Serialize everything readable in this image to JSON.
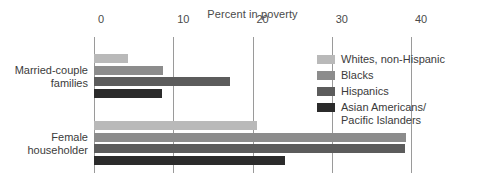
{
  "chart_data": {
    "type": "bar",
    "orientation": "horizontal",
    "title": "Percent in poverty",
    "xlabel": "",
    "ylabel": "",
    "xlim": [
      0,
      42
    ],
    "xticks": [
      0,
      10,
      20,
      30,
      40
    ],
    "xtick_labels": [
      "0",
      "10",
      "20",
      "30",
      "40"
    ],
    "grid": true,
    "legend_position": "right",
    "categories": [
      "Married-couple\nfamilies",
      "Female\nhouseholder"
    ],
    "series": [
      {
        "name": "Whites, non-Hispanic",
        "color": "#b9b9b9",
        "values": [
          4.3,
          20.6
        ]
      },
      {
        "name": "Blacks",
        "color": "#8c8c8c",
        "values": [
          8.7,
          39.4
        ]
      },
      {
        "name": "Hispanics",
        "color": "#5c5c5c",
        "values": [
          17.2,
          39.3
        ]
      },
      {
        "name": "Asian Americans/\nPacific Islanders",
        "color": "#2b2b2b",
        "values": [
          8.6,
          24.1
        ]
      }
    ]
  },
  "axis": {
    "tick_0": "0",
    "tick_10": "10",
    "tick_20": "20",
    "tick_30": "30",
    "tick_40": "40"
  },
  "categories": {
    "group_1": "Married-couple\nfamilies",
    "group_2": "Female\nhouseholder"
  },
  "legend": {
    "item_1": "Whites, non-Hispanic",
    "item_2": "Blacks",
    "item_3": "Hispanics",
    "item_4": "Asian Americans/\nPacific Islanders"
  },
  "title": "Percent in poverty"
}
